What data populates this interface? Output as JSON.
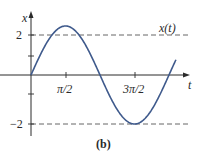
{
  "chart_data": {
    "type": "line",
    "title": "",
    "caption": "(b)",
    "xlabel": "t",
    "ylabel": "x",
    "series": [
      {
        "name": "x(t)",
        "function": "2.5*sin(t)",
        "x": [
          0,
          0.785,
          1.571,
          2.356,
          3.142,
          3.927,
          4.712,
          5.498,
          6.283,
          6.6
        ],
        "values": [
          0,
          1.77,
          2.5,
          1.77,
          0,
          -1.77,
          -2.5,
          -1.77,
          0,
          0.79
        ]
      }
    ],
    "x_ticks": [
      {
        "value": 1.5708,
        "label": "π/2"
      },
      {
        "value": 4.7124,
        "label": "3π/2"
      }
    ],
    "y_ticks": [
      {
        "value": 2,
        "label": "2"
      },
      {
        "value": 1,
        "label": ""
      },
      {
        "value": -1,
        "label": ""
      },
      {
        "value": -2,
        "label": "−2"
      }
    ],
    "reference_lines": [
      {
        "y": 2,
        "style": "dashed"
      },
      {
        "y": -2,
        "style": "dashed"
      }
    ],
    "annotations": [
      {
        "text": "x(t)",
        "near_y": 2
      }
    ],
    "xlim": [
      0,
      6.9
    ],
    "ylim": [
      -3.2,
      3.2
    ],
    "grid": false,
    "colors": {
      "curve": "#3f5a8c",
      "axes": "#2a2a2a",
      "dashed": "#555555"
    }
  },
  "labels": {
    "y_axis": "x",
    "x_axis": "t",
    "y_tick_pos": "2",
    "y_tick_neg": "−2",
    "x_tick_1": "π/2",
    "x_tick_2": "3π/2",
    "curve_label": "x(t)",
    "caption": "(b)"
  }
}
